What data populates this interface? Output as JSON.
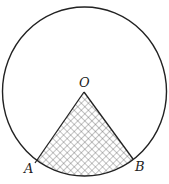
{
  "diagram": {
    "type": "circle-sector",
    "shading": "crosshatch",
    "colors": {
      "stroke": "#222222",
      "hatch": "#555555",
      "background": "#ffffff"
    },
    "circle": {
      "cx": 84.5,
      "cy": 91.5,
      "rx": 82,
      "ry": 84.5
    },
    "points": {
      "O": {
        "label": "O",
        "x": 84,
        "y": 92
      },
      "A": {
        "label": "A",
        "x": 35,
        "y": 163
      },
      "B": {
        "label": "B",
        "x": 133,
        "y": 159
      }
    },
    "shaded_region": "sector AOB"
  }
}
